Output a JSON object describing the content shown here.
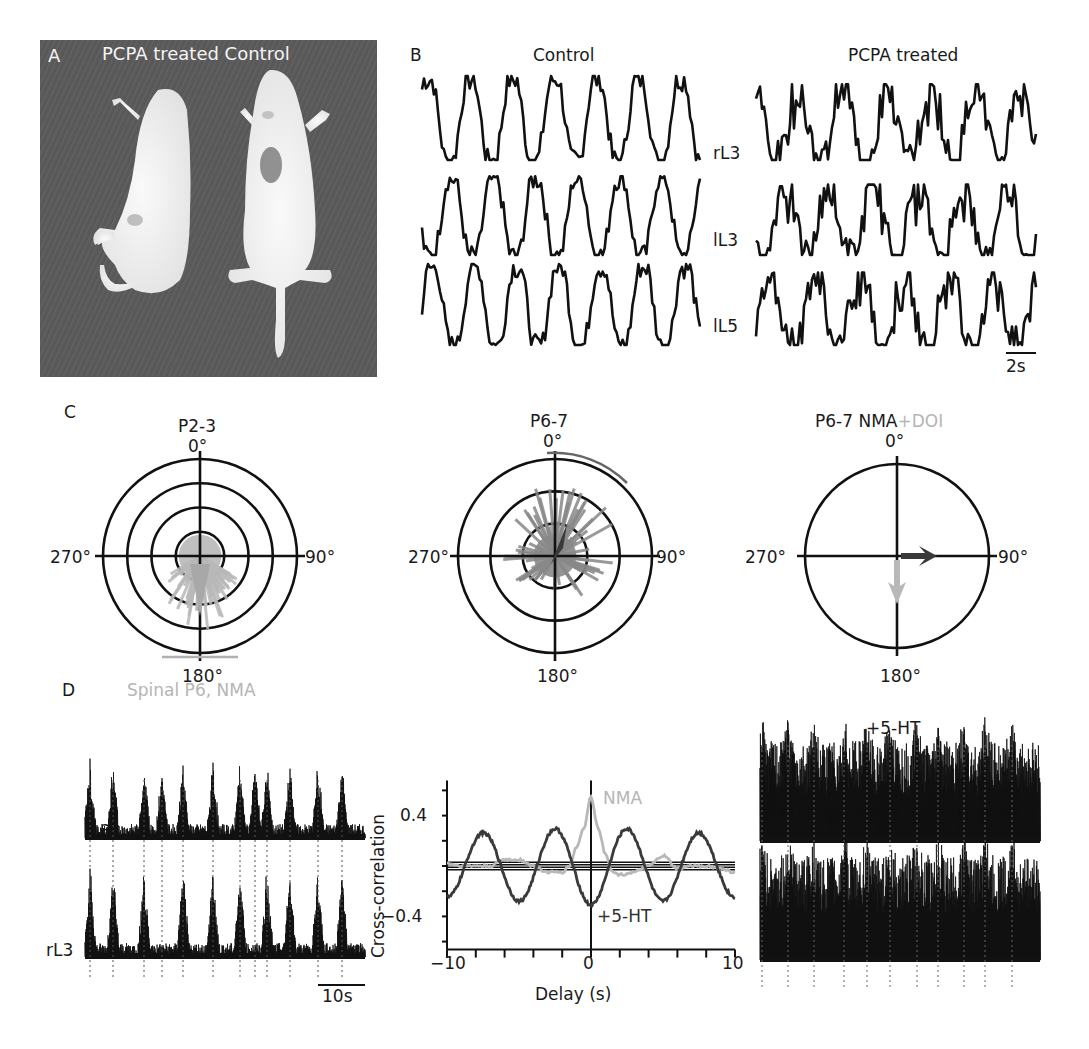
{
  "figure": {
    "panels": {
      "A": {
        "letter": "A",
        "title": "PCPA treated Control",
        "image_description": "Photograph of two neonatal rats on dark fabric: PCPA treated (left, curled) and Control (right)"
      },
      "B": {
        "letter": "B",
        "column_titles": [
          "Control",
          "PCPA treated"
        ],
        "row_labels": [
          "rL3",
          "lL3",
          "lL5"
        ],
        "scale_bar_label": "2s"
      },
      "C": {
        "letter": "C",
        "plots": [
          {
            "title": "P2-3",
            "title_extra": ""
          },
          {
            "title": "P6-7",
            "title_extra": ""
          },
          {
            "title": "P6-7 NMA",
            "title_extra": "+DOI"
          }
        ],
        "angle_labels": {
          "top": "0°",
          "right": "90°",
          "bottom": "180°",
          "left": "270°"
        }
      },
      "D": {
        "letter": "D",
        "left_title": "Spinal P6, NMA",
        "left_row_labels": [
          "lL3",
          "rL3"
        ],
        "left_scale_bar_label": "10s",
        "right_title": "+5-HT"
      }
    },
    "colors": {
      "ink": "#111111",
      "light_gray": "#b8b8b8",
      "mid_gray": "#808080",
      "dark_gray": "#3a3a3a"
    }
  },
  "chart_data": [
    {
      "type": "line",
      "title": "B — Control ventral root recordings",
      "series": [
        {
          "name": "rL3",
          "description": "rhythmic bursts, ~6.5 cycles per window"
        },
        {
          "name": "lL3",
          "description": "rhythmic bursts alternating"
        },
        {
          "name": "lL5",
          "description": "rhythmic bursts"
        }
      ],
      "scale_bar": "2s"
    },
    {
      "type": "line",
      "title": "B — PCPA treated ventral root recordings",
      "series": [
        {
          "name": "rL3"
        },
        {
          "name": "lL3"
        },
        {
          "name": "lL5"
        }
      ],
      "scale_bar": "2s"
    },
    {
      "type": "scatter",
      "title": "P2-3",
      "subtype": "polar",
      "angle_ticks": [
        "0°",
        "90°",
        "180°",
        "270°"
      ],
      "rings": 4,
      "mean_direction_deg": 180,
      "vector_color": "#b8b8b8",
      "arc_range_deg": [
        168,
        192
      ]
    },
    {
      "type": "scatter",
      "title": "P6-7",
      "subtype": "polar",
      "angle_ticks": [
        "0°",
        "90°",
        "180°",
        "270°"
      ],
      "rings": 3,
      "mean_direction_deg": 20,
      "vector_color": "#3a3a3a",
      "arc_range_deg": [
        356,
        40
      ]
    },
    {
      "type": "scatter",
      "title": "P6-7 NMA+DOI",
      "subtype": "polar",
      "angle_ticks": [
        "0°",
        "90°",
        "180°",
        "270°"
      ],
      "rings": 1,
      "vectors": [
        {
          "name": "NMA",
          "direction_deg": 90,
          "length": 0.35,
          "color": "#3a3a3a"
        },
        {
          "name": "DOI",
          "direction_deg": 180,
          "length": 0.5,
          "color": "#b8b8b8"
        }
      ]
    },
    {
      "type": "line",
      "title": "Cross-correlation",
      "xlabel": "Delay (s)",
      "ylabel": "Cross-correlation",
      "xlim": [
        -10,
        10
      ],
      "ylim": [
        -0.6,
        0.6
      ],
      "xticks": [
        -10,
        0,
        10
      ],
      "yticks": [
        -0.4,
        0.4
      ],
      "series": [
        {
          "name": "NMA",
          "color": "#b8b8b8",
          "x": [
            -10,
            -9,
            -8,
            -7,
            -6,
            -5,
            -4,
            -3,
            -2,
            -1.5,
            -1,
            -0.5,
            0,
            0.5,
            1,
            1.5,
            2,
            3,
            4,
            5,
            6,
            7,
            8,
            9,
            10
          ],
          "y": [
            0.02,
            0.0,
            0.0,
            0.0,
            0.05,
            0.05,
            0.0,
            -0.05,
            -0.05,
            0.0,
            0.15,
            0.3,
            0.55,
            0.3,
            0.1,
            -0.05,
            -0.07,
            -0.05,
            0.0,
            0.08,
            -0.02,
            0.0,
            0.0,
            -0.02,
            -0.05
          ]
        },
        {
          "name": "+5-HT",
          "color": "#3a3a3a",
          "x": [
            -10,
            -9,
            -8,
            -7,
            -6,
            -5,
            -4,
            -3,
            -2,
            -1,
            0,
            1,
            2,
            3,
            4,
            5,
            6,
            7,
            8,
            9,
            10
          ],
          "y": [
            -0.2,
            0.05,
            0.24,
            0.15,
            -0.12,
            -0.25,
            -0.05,
            0.28,
            0.2,
            -0.1,
            -0.35,
            -0.05,
            0.3,
            0.25,
            -0.05,
            -0.25,
            -0.1,
            0.2,
            0.22,
            0.0,
            -0.18
          ]
        }
      ],
      "reference_lines_y": [
        0.03,
        0.01,
        -0.01,
        -0.03
      ],
      "annotations": [
        "NMA",
        "+5-HT"
      ]
    }
  ]
}
